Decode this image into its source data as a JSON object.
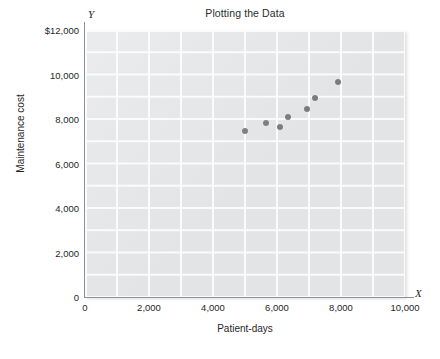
{
  "chart_data": {
    "type": "scatter",
    "title": "Plotting the Data",
    "xlabel": "Patient-days",
    "ylabel": "Maintenance cost",
    "xlim": [
      0,
      10000
    ],
    "ylim": [
      0,
      12000
    ],
    "grid": true,
    "grid_step_x": 1000,
    "grid_step_y": 1000,
    "legend": "none",
    "x_axis_marker": "X",
    "y_axis_marker": "Y",
    "x_ticks": [
      "0",
      "2,000",
      "4,000",
      "6,000",
      "8,000",
      "10,000"
    ],
    "x_tick_values": [
      0,
      2000,
      4000,
      6000,
      8000,
      10000
    ],
    "y_ticks": [
      "0",
      "2,000",
      "4,000",
      "6,000",
      "8,000",
      "10,000",
      "$12,000"
    ],
    "y_tick_values": [
      0,
      2000,
      4000,
      6000,
      8000,
      10000,
      12000
    ],
    "series": [
      {
        "name": "Maintenance cost vs patient-days",
        "marker": "circle",
        "color": "#77797c",
        "points": [
          {
            "x": 5000,
            "y": 7450
          },
          {
            "x": 5650,
            "y": 7800
          },
          {
            "x": 6100,
            "y": 7650
          },
          {
            "x": 6350,
            "y": 8100
          },
          {
            "x": 6950,
            "y": 8450
          },
          {
            "x": 7200,
            "y": 8950
          },
          {
            "x": 7900,
            "y": 9650
          }
        ]
      }
    ],
    "colors": {
      "plot_background": "#e3e4e6",
      "gridline": "#fbfbfb",
      "axis": "#8e9093",
      "marker": "#77797c",
      "text": "#1f1f1f",
      "page_background": "#ffffff"
    }
  }
}
